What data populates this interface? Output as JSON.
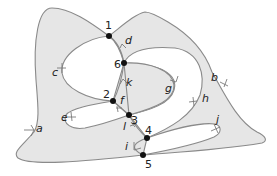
{
  "diagram": {
    "type": "planar-graph-surface",
    "vertices": [
      {
        "id": "1",
        "label": "1",
        "x": 109,
        "y": 36
      },
      {
        "id": "2",
        "label": "2",
        "x": 113,
        "y": 101
      },
      {
        "id": "3",
        "label": "3",
        "x": 129,
        "y": 115
      },
      {
        "id": "4",
        "label": "4",
        "x": 147,
        "y": 138
      },
      {
        "id": "5",
        "label": "5",
        "x": 143,
        "y": 155
      },
      {
        "id": "6",
        "label": "6",
        "x": 124,
        "y": 63
      }
    ],
    "edges": [
      {
        "id": "a",
        "label": "a"
      },
      {
        "id": "b",
        "label": "b"
      },
      {
        "id": "c",
        "label": "c"
      },
      {
        "id": "d",
        "label": "d"
      },
      {
        "id": "e",
        "label": "e"
      },
      {
        "id": "f",
        "label": "f"
      },
      {
        "id": "g",
        "label": "g"
      },
      {
        "id": "h",
        "label": "h"
      },
      {
        "id": "i",
        "label": "i"
      },
      {
        "id": "j",
        "label": "j"
      },
      {
        "id": "k",
        "label": "k"
      },
      {
        "id": "l",
        "label": "l"
      }
    ],
    "colors": {
      "fill": "#e6e6e6",
      "stroke": "#8a8a8a",
      "vertex": "#111111",
      "background": "#ffffff"
    }
  }
}
